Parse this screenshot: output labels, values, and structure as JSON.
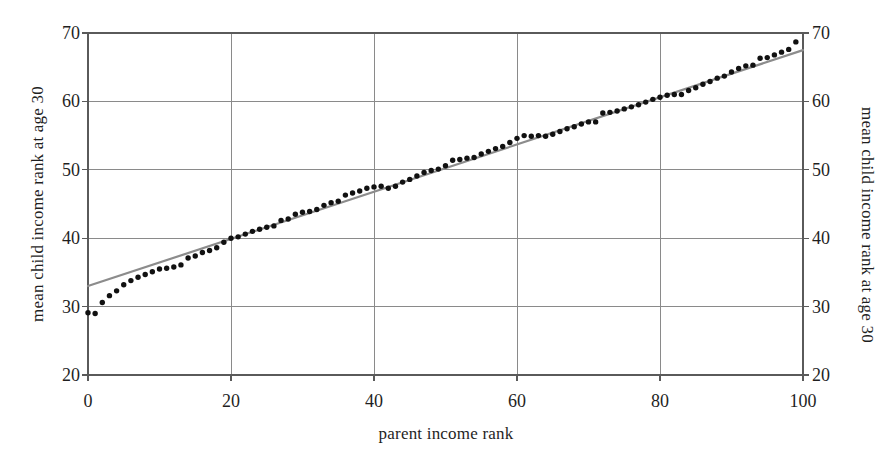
{
  "figure": {
    "background_color": "#ffffff",
    "axis_color": "#5a5a5a",
    "grid_color": "#8a8a8a",
    "point_color": "#111111",
    "fit_line_color": "#8c8c8c"
  },
  "axes": {
    "x_title": "parent income rank",
    "y_title_left": "mean child income rank at age 30",
    "y_title_right": "mean child income rank at age 30",
    "x_ticks": [
      "0",
      "20",
      "40",
      "60",
      "80",
      "100"
    ],
    "y_ticks_left": [
      "70",
      "60",
      "50",
      "40",
      "30",
      "20"
    ],
    "y_ticks_right": [
      "70",
      "60",
      "50",
      "40",
      "30",
      "20"
    ]
  },
  "chart_data": {
    "type": "scatter",
    "title": "",
    "xlabel": "parent income rank",
    "ylabel": "mean child income rank at age 30",
    "xlim": [
      0,
      100
    ],
    "ylim": [
      20,
      70
    ],
    "xticks": [
      0,
      20,
      40,
      60,
      80,
      100
    ],
    "yticks": [
      20,
      30,
      40,
      50,
      60,
      70
    ],
    "grid": true,
    "legend": "none",
    "series": [
      {
        "name": "mean child income rank at age 30",
        "type": "scatter",
        "marker": "filled-circle",
        "color": "#111111",
        "x": [
          0,
          1,
          2,
          3,
          4,
          5,
          6,
          7,
          8,
          9,
          10,
          11,
          12,
          13,
          14,
          15,
          16,
          17,
          18,
          19,
          20,
          21,
          22,
          23,
          24,
          25,
          26,
          27,
          28,
          29,
          30,
          31,
          32,
          33,
          34,
          35,
          36,
          37,
          38,
          39,
          40,
          41,
          42,
          43,
          44,
          45,
          46,
          47,
          48,
          49,
          50,
          51,
          52,
          53,
          54,
          55,
          56,
          57,
          58,
          59,
          60,
          61,
          62,
          63,
          64,
          65,
          66,
          67,
          68,
          69,
          70,
          71,
          72,
          73,
          74,
          75,
          76,
          77,
          78,
          79,
          80,
          81,
          82,
          83,
          84,
          85,
          86,
          87,
          88,
          89,
          90,
          91,
          92,
          93,
          94,
          95,
          96,
          97,
          98,
          99
        ],
        "y": [
          29.1,
          29.0,
          30.6,
          31.6,
          32.3,
          33.2,
          33.8,
          34.3,
          34.7,
          35.1,
          35.5,
          35.6,
          35.8,
          36.1,
          37.1,
          37.4,
          37.9,
          38.2,
          38.6,
          39.4,
          40.0,
          40.2,
          40.6,
          41.0,
          41.3,
          41.6,
          41.8,
          42.6,
          42.8,
          43.5,
          43.8,
          43.9,
          44.2,
          44.8,
          45.2,
          45.4,
          46.3,
          46.6,
          46.9,
          47.3,
          47.5,
          47.6,
          47.3,
          47.6,
          48.2,
          48.6,
          49.1,
          49.6,
          49.9,
          50.1,
          50.6,
          51.4,
          51.5,
          51.7,
          51.8,
          52.3,
          52.7,
          53.1,
          53.4,
          54.0,
          54.6,
          55.0,
          54.9,
          55.0,
          54.9,
          55.2,
          55.6,
          56.0,
          56.3,
          56.7,
          57.0,
          57.0,
          58.3,
          58.4,
          58.6,
          58.9,
          59.2,
          59.5,
          59.9,
          60.3,
          60.6,
          60.9,
          61.0,
          61.0,
          61.6,
          62.0,
          62.5,
          62.9,
          63.4,
          63.7,
          64.3,
          64.8,
          65.2,
          65.3,
          66.3,
          66.4,
          66.8,
          67.2,
          67.6,
          68.7
        ]
      },
      {
        "name": "linear fit",
        "type": "line",
        "color": "#8c8c8c",
        "slope": 0.345,
        "intercept": 33.0,
        "x": [
          0,
          100
        ],
        "y": [
          33.0,
          67.5
        ]
      }
    ]
  }
}
